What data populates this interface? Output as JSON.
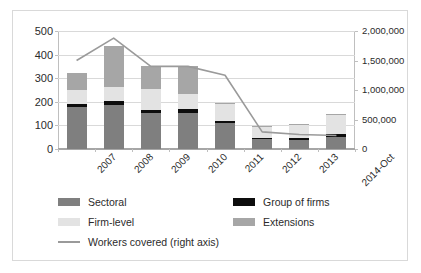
{
  "chart_data": {
    "type": "bar",
    "title": "",
    "subtitle": "",
    "xlabel": "",
    "ylabel": "",
    "y2label": "",
    "grid": true,
    "legend_position": "bottom",
    "categories": [
      "2007",
      "2008",
      "2009",
      "2010",
      "2011",
      "2012",
      "2013",
      "2014-Oct"
    ],
    "ylim": [
      0,
      500
    ],
    "yticks": [
      "0",
      "100",
      "200",
      "300",
      "400",
      "500"
    ],
    "ytick_values": [
      0,
      100,
      200,
      300,
      400,
      500
    ],
    "y2lim": [
      0,
      2000000
    ],
    "y2ticks": [
      "0",
      "500,000",
      "1,000,000",
      "1,500,000",
      "2,000,000"
    ],
    "y2tick_values": [
      0,
      500000,
      1000000,
      1500000,
      2000000
    ],
    "stacked": true,
    "series": [
      {
        "name": "Sectoral",
        "color": "#7f7f7f",
        "axis": "left",
        "values": [
          178,
          186,
          152,
          152,
          110,
          42,
          40,
          53
        ]
      },
      {
        "name": "Group of firms",
        "color": "#0d0d0d",
        "axis": "left",
        "values": [
          14,
          17,
          15,
          17,
          9,
          6,
          5,
          12
        ]
      },
      {
        "name": "Firm-level",
        "color": "#e3e3e3",
        "axis": "left",
        "values": [
          60,
          61,
          89,
          63,
          71,
          46,
          58,
          82
        ]
      },
      {
        "name": "Extensions",
        "color": "#a6a6a6",
        "axis": "left",
        "values": [
          71,
          172,
          95,
          119,
          4,
          3,
          2,
          2
        ]
      }
    ],
    "line_series": {
      "name": "Workers covered (right axis)",
      "color": "#9a9a9a",
      "axis": "right",
      "values": [
        1500000,
        1880000,
        1400000,
        1400000,
        1250000,
        290000,
        245000,
        230000
      ]
    }
  },
  "legend": {
    "items": [
      {
        "label": "Sectoral",
        "color": "#7f7f7f",
        "type": "swatch"
      },
      {
        "label": "Group of firms",
        "color": "#0d0d0d",
        "type": "swatch"
      },
      {
        "label": "Firm-level",
        "color": "#e3e3e3",
        "type": "swatch"
      },
      {
        "label": "Extensions",
        "color": "#a6a6a6",
        "type": "swatch"
      },
      {
        "label": "Workers covered (right axis)",
        "color": "#9a9a9a",
        "type": "line"
      }
    ]
  }
}
